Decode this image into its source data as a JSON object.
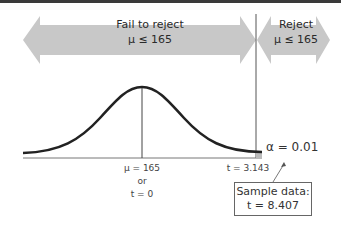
{
  "diagram": {
    "type": "hypothesis-test t-distribution",
    "colors": {
      "arrow_fill": "#c8c8c8",
      "curve": "#222222",
      "axis": "#555555",
      "top_strip": "#3a3a3a"
    },
    "regions": {
      "fail_to_reject": {
        "title": "Fail to reject",
        "hypothesis": "μ ≤ 165"
      },
      "reject": {
        "title": "Reject",
        "hypothesis": "μ ≤ 165"
      }
    },
    "axis_labels": {
      "center_mu": "μ = 165",
      "center_or": "or",
      "center_t": "t = 0",
      "critical": "t = 3.143"
    },
    "alpha_label": "α = 0.01",
    "sample_box": {
      "line1": "Sample data:",
      "line2": "t = 8.407"
    }
  }
}
